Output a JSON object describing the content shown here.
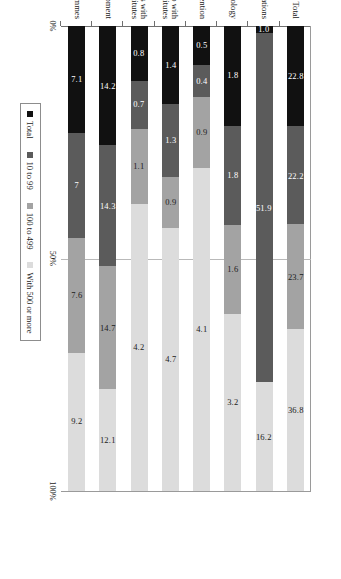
{
  "chart_data": {
    "type": "bar",
    "subtype": "100% stacked horizontal bar",
    "title": "",
    "xlabel": "",
    "ylabel": "",
    "orientation": "rotated-90",
    "grid": true,
    "legend_position": "bottom",
    "xlim": [
      0,
      100
    ],
    "xticks": [
      "0%",
      "50%",
      "100%"
    ],
    "categories": [
      "Total",
      "Law of innovations",
      "Law of informatics technology",
      "Subvention",
      "Innovation projects developed in partnership with\nuniversities and research institutes",
      "Funding for projects in partnerships with\nuniversities and research institutes",
      "Financing the purchase of machinery and equipment",
      "Other support programmes"
    ],
    "series": [
      {
        "name": "Total",
        "color": "#111111",
        "values": [
          22.8,
          1.0,
          1.8,
          0.5,
          1.4,
          0.8,
          14.2,
          7.1
        ]
      },
      {
        "name": "10 to 99",
        "color": "#5b5b5b",
        "values": [
          22.2,
          51.9,
          1.8,
          0.4,
          1.3,
          0.7,
          14.3,
          7.0
        ]
      },
      {
        "name": "100 to 499",
        "color": "#a3a3a3",
        "values": [
          23.7,
          0.0,
          1.6,
          0.9,
          0.9,
          1.1,
          14.7,
          7.6
        ]
      },
      {
        "name": "With 500 or more",
        "color": "#dcdcdc",
        "values": [
          36.8,
          16.2,
          3.2,
          4.1,
          4.7,
          4.2,
          12.1,
          9.2
        ]
      }
    ],
    "value_labels": [
      [
        "22.8",
        "22.2",
        "23.7",
        "36.8"
      ],
      [
        "1.0",
        "51.9",
        "",
        "16.2"
      ],
      [
        "1.8",
        "1.8",
        "1.6",
        "3.2"
      ],
      [
        "0.5",
        "0.4",
        "0.9",
        "4.1"
      ],
      [
        "1.4",
        "1.3",
        "0.9",
        "4.7"
      ],
      [
        "0.8",
        "0.7",
        "1.1",
        "4.2"
      ],
      [
        "14.2",
        "14.3",
        "14.7",
        "12.1"
      ],
      [
        "7.1",
        "7",
        "7.6",
        "9.2"
      ]
    ]
  },
  "legend": {
    "items": [
      {
        "label": "Total"
      },
      {
        "label": "10 to 99"
      },
      {
        "label": "100 to 499"
      },
      {
        "label": "With 500 or more"
      }
    ]
  },
  "axis": {
    "ticks": [
      {
        "label": "0%",
        "pos": 0
      },
      {
        "label": "50%",
        "pos": 50
      },
      {
        "label": "100%",
        "pos": 100
      }
    ]
  }
}
